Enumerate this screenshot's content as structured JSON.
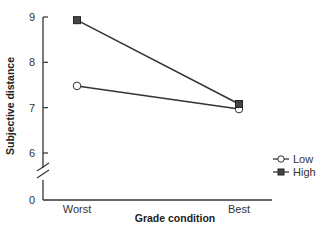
{
  "chart_data": {
    "type": "line",
    "title": "",
    "xlabel": "Grade condition",
    "ylabel": "Subjective distance",
    "categories": [
      "Worst",
      "Best"
    ],
    "y_ticks": [
      0,
      6,
      7,
      8,
      9
    ],
    "ylim": [
      6,
      9
    ],
    "y_axis_break": true,
    "grid": false,
    "legend_position": "right",
    "series": [
      {
        "name": "Low",
        "marker": "open-circle",
        "values": [
          7.48,
          6.97
        ]
      },
      {
        "name": "High",
        "marker": "filled-square",
        "values": [
          8.93,
          7.08
        ]
      }
    ]
  },
  "colors": {
    "line": "#333333",
    "marker_fill_high": "#444444",
    "marker_fill_low": "#ffffff"
  }
}
